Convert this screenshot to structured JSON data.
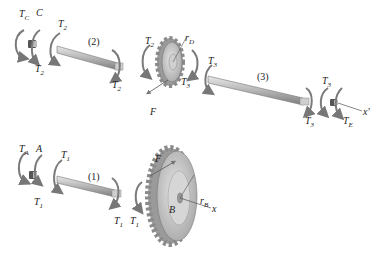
{
  "diagram": {
    "type": "free-body diagram of shafts and gears (exploded view)",
    "colors": {
      "shaft": "#b9b9b9",
      "shaft_dark": "#8a8a8a",
      "gear": "#c8c8c8",
      "gear_dark": "#8e8e8e",
      "arrow": "#7a7a7a",
      "text": "#222222"
    },
    "top_assembly": {
      "labels": {
        "tc": "T",
        "tc_sub": "C",
        "c": "C",
        "t2_a": "T",
        "t2_a_sub": "2",
        "t2_b": "T",
        "t2_b_sub": "2",
        "shaft2": "(2)",
        "t2_c": "T",
        "t2_c_sub": "2",
        "t2_d": "T",
        "t2_d_sub": "2",
        "rd": "r",
        "rd_sub": "D",
        "t3_a": "T",
        "t3_a_sub": "3",
        "f": "F",
        "t3_b": "T",
        "t3_b_sub": "3",
        "shaft3": "(3)",
        "t3_c": "T",
        "t3_c_sub": "3",
        "t3_d": "T",
        "t3_d_sub": "3",
        "te": "T",
        "te_sub": "E",
        "xprime": "x′"
      }
    },
    "bottom_assembly": {
      "labels": {
        "ta": "T",
        "ta_sub": "A",
        "a": "A",
        "t1_a": "T",
        "t1_a_sub": "1",
        "t1_b": "T",
        "t1_b_sub": "1",
        "shaft1": "(1)",
        "t1_c": "T",
        "t1_c_sub": "1",
        "t1_d": "T",
        "t1_d_sub": "1",
        "f": "F",
        "rb": "r",
        "rb_sub": "B",
        "b": "B",
        "x": "x"
      }
    }
  }
}
